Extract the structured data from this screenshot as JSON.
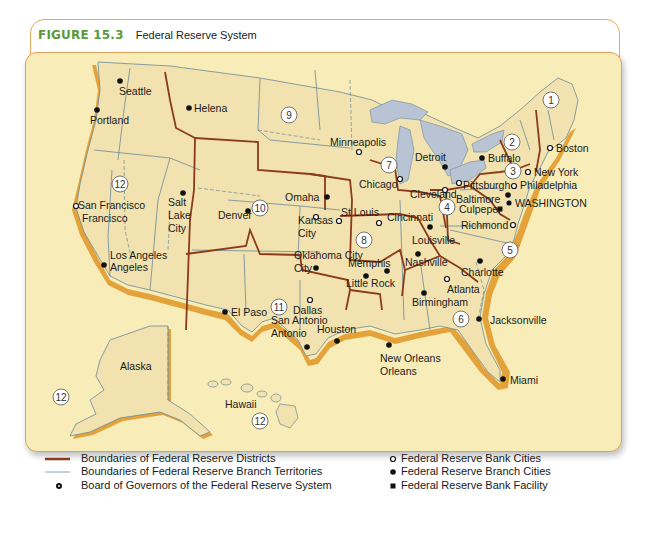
{
  "figure": {
    "number": "FIGURE 15.3",
    "title": "Federal Reserve System"
  },
  "colors": {
    "accent_green": "#5a9a3a",
    "frame_orange": "#e8a861",
    "map_background": "#f8ecb8",
    "land": "#f2e2b0",
    "water": "#b8c4d4",
    "district_boundary": "#8b3a1a",
    "branch_boundary": "#6a8a9a",
    "coast_shadow": "#e3a33a"
  },
  "map": {
    "districts": [
      {
        "num": "1",
        "x": 551,
        "y": 100
      },
      {
        "num": "2",
        "x": 512,
        "y": 142
      },
      {
        "num": "3",
        "x": 513,
        "y": 171
      },
      {
        "num": "4",
        "x": 447,
        "y": 207
      },
      {
        "num": "5",
        "x": 510,
        "y": 250
      },
      {
        "num": "6",
        "x": 461,
        "y": 319
      },
      {
        "num": "7",
        "x": 389,
        "y": 165
      },
      {
        "num": "8",
        "x": 364,
        "y": 240
      },
      {
        "num": "9",
        "x": 289,
        "y": 115
      },
      {
        "num": "10",
        "x": 260,
        "y": 208
      },
      {
        "num": "11",
        "x": 279,
        "y": 307
      },
      {
        "num": "12a",
        "label": "12",
        "x": 120,
        "y": 184
      },
      {
        "num": "12b",
        "label": "12",
        "x": 61,
        "y": 397
      },
      {
        "num": "12c",
        "label": "12",
        "x": 260,
        "y": 421
      }
    ],
    "cities": [
      {
        "name": "Seattle",
        "type": "branch",
        "dx": 120,
        "dy": 81,
        "lx": 119,
        "ly": 95
      },
      {
        "name": "Portland",
        "type": "branch",
        "dx": 97,
        "dy": 110,
        "lx": 90,
        "ly": 124
      },
      {
        "name": "Helena",
        "type": "branch",
        "dx": 189,
        "dy": 108,
        "lx": 194,
        "ly": 112
      },
      {
        "name": "Minneapolis",
        "type": "bank",
        "dx": 359,
        "dy": 152,
        "lx": 330,
        "ly": 146
      },
      {
        "name": "Chicago",
        "type": "bank",
        "dx": 400,
        "dy": 179,
        "lx": 359,
        "ly": 188
      },
      {
        "name": "Detroit",
        "type": "branch",
        "dx": 445,
        "dy": 167,
        "lx": 415,
        "ly": 161
      },
      {
        "name": "Buffalo",
        "type": "branch",
        "dx": 482,
        "dy": 158,
        "lx": 488,
        "ly": 162
      },
      {
        "name": "Boston",
        "type": "bank",
        "dx": 550,
        "dy": 148,
        "lx": 556,
        "ly": 152
      },
      {
        "name": "New York",
        "type": "bank",
        "dx": 528,
        "dy": 172,
        "lx": 534,
        "ly": 176
      },
      {
        "name": "Philadelphia",
        "type": "bank",
        "dx": 514,
        "dy": 186,
        "lx": 520,
        "ly": 189
      },
      {
        "name": "Pittsburgh",
        "type": "bank",
        "dx": 459,
        "dy": 183,
        "lx": 463,
        "ly": 189
      },
      {
        "name": "Cleveland",
        "type": "bank",
        "dx": 445,
        "dy": 190,
        "lx": 410,
        "ly": 198
      },
      {
        "name": "Baltimore",
        "type": "branch",
        "dx": 508,
        "dy": 195,
        "lx": 456,
        "ly": 203
      },
      {
        "name": "WASHINGTON",
        "type": "board",
        "dx": 509,
        "dy": 203,
        "lx": 515,
        "ly": 207
      },
      {
        "name": "Culpeper",
        "type": "facility",
        "dx": 500,
        "dy": 209,
        "lx": 459,
        "ly": 213
      },
      {
        "name": "Richmond",
        "type": "bank",
        "dx": 513,
        "dy": 225,
        "lx": 461,
        "ly": 229
      },
      {
        "name": "Cincinnati",
        "type": "bank",
        "dx": 379,
        "dy": 223,
        "lx": 387,
        "ly": 221
      },
      {
        "name": "Louisville",
        "type": "branch",
        "dx": 430,
        "dy": 227,
        "lx": 412,
        "ly": 244
      },
      {
        "name": "St Louis",
        "type": "bank",
        "dx": 339,
        "dy": 221,
        "lx": 341,
        "ly": 216
      },
      {
        "name": "Omaha",
        "type": "branch",
        "dx": 327,
        "dy": 197,
        "lx": 285,
        "ly": 201
      },
      {
        "name": "Kansas",
        "type": "bank",
        "dx": 316,
        "dy": 217,
        "lx": 298,
        "ly": 224
      },
      {
        "name": "Denver",
        "type": "branch",
        "dx": 248,
        "dy": 211,
        "lx": 218,
        "ly": 219
      },
      {
        "name": "Salt",
        "type": "branch",
        "dx": 183,
        "dy": 193,
        "lx": 168,
        "ly": 206
      },
      {
        "name": "San Francisco",
        "type": "bank",
        "dx": 76,
        "dy": 206,
        "lx": 78,
        "ly": 209
      },
      {
        "name": "Los Angeles",
        "type": "branch",
        "dx": 104,
        "dy": 265,
        "lx": 110,
        "ly": 259
      },
      {
        "name": "Oklahoma City",
        "type": "branch",
        "dx": 316,
        "dy": 268,
        "lx": 294,
        "ly": 259
      },
      {
        "name": "Memphis",
        "type": "branch",
        "dx": 387,
        "dy": 271,
        "lx": 348,
        "ly": 267
      },
      {
        "name": "Little Rock",
        "type": "branch",
        "dx": 366,
        "dy": 276,
        "lx": 346,
        "ly": 287
      },
      {
        "name": "Nashville",
        "type": "branch",
        "dx": 418,
        "dy": 254,
        "lx": 405,
        "ly": 266
      },
      {
        "name": "Atlanta",
        "type": "bank",
        "dx": 447,
        "dy": 279,
        "lx": 447,
        "ly": 293
      },
      {
        "name": "Charlotte",
        "type": "branch",
        "dx": 480,
        "dy": 261,
        "lx": 461,
        "ly": 276
      },
      {
        "name": "Birmingham",
        "type": "branch",
        "dx": 424,
        "dy": 293,
        "lx": 412,
        "ly": 306
      },
      {
        "name": "Jacksonville",
        "type": "branch",
        "dx": 479,
        "dy": 319,
        "lx": 490,
        "ly": 324
      },
      {
        "name": "Miami",
        "type": "branch",
        "dx": 503,
        "dy": 379,
        "lx": 510,
        "ly": 384
      },
      {
        "name": "New Orleans",
        "type": "branch",
        "dx": 389,
        "dy": 345,
        "lx": 380,
        "ly": 362
      },
      {
        "name": "Houston",
        "type": "branch",
        "dx": 337,
        "dy": 341,
        "lx": 317,
        "ly": 333
      },
      {
        "name": "Dallas",
        "type": "bank",
        "dx": 310,
        "dy": 300,
        "lx": 293,
        "ly": 314
      },
      {
        "name": "San Antonio",
        "type": "branch",
        "dx": 307,
        "dy": 347,
        "lx": 271,
        "ly": 324
      },
      {
        "name": "El Paso",
        "type": "branch",
        "dx": 225,
        "dy": 312,
        "lx": 231,
        "ly": 316
      }
    ],
    "extra_labels": [
      {
        "text": "Francisco",
        "x": 82,
        "y": 222
      },
      {
        "text": "Lake",
        "x": 168,
        "y": 219
      },
      {
        "text": "City",
        "x": 168,
        "y": 232
      },
      {
        "text": "City",
        "x": 298,
        "y": 237
      },
      {
        "text": "Angeles",
        "x": 110,
        "y": 271
      },
      {
        "text": "City",
        "x": 294,
        "y": 272
      },
      {
        "text": "Antonio",
        "x": 271,
        "y": 337
      },
      {
        "text": "Orleans",
        "x": 380,
        "y": 375
      },
      {
        "text": "Alaska",
        "x": 120,
        "y": 370
      },
      {
        "text": "Hawaii",
        "x": 225,
        "y": 408
      }
    ]
  },
  "legend": {
    "left": [
      {
        "symbol": "district-line",
        "label": "Boundaries of Federal Reserve Districts"
      },
      {
        "symbol": "branch-line",
        "label": "Boundaries of Federal Reserve Branch Territories"
      },
      {
        "symbol": "board-dot",
        "label": "Board of Governors of the Federal Reserve System"
      }
    ],
    "right": [
      {
        "symbol": "open-circle",
        "label": "Federal Reserve Bank Cities"
      },
      {
        "symbol": "filled-circle",
        "label": "Federal Reserve Branch Cities"
      },
      {
        "symbol": "filled-square",
        "label": "Federal Reserve Bank Facility"
      }
    ]
  }
}
